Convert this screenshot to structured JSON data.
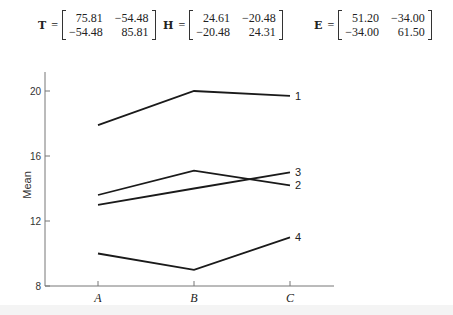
{
  "matrices": [
    {
      "name": "T",
      "values": [
        [
          "75.81",
          "−54.48"
        ],
        [
          "−54.48",
          "85.81"
        ]
      ]
    },
    {
      "name": "H",
      "values": [
        [
          "24.61",
          "−20.48"
        ],
        [
          "−20.48",
          "24.31"
        ]
      ]
    },
    {
      "name": "E",
      "values": [
        [
          "51.20",
          "−34.00"
        ],
        [
          "−34.00",
          "61.50"
        ]
      ]
    }
  ],
  "chart_data": {
    "type": "line",
    "title": "",
    "xlabel": "",
    "ylabel": "Mean",
    "categories": [
      "A",
      "B",
      "C"
    ],
    "ylim": [
      8,
      21
    ],
    "yticks": [
      8,
      12,
      16,
      20
    ],
    "grid": false,
    "legend": "inline labels at right end of lines",
    "series": [
      {
        "name": "1",
        "values": [
          17.9,
          20.0,
          19.7
        ]
      },
      {
        "name": "2",
        "values": [
          13.6,
          15.1,
          14.2
        ]
      },
      {
        "name": "3",
        "values": [
          13.0,
          14.0,
          15.0
        ]
      },
      {
        "name": "4",
        "values": [
          10.0,
          9.0,
          11.0
        ]
      }
    ]
  }
}
